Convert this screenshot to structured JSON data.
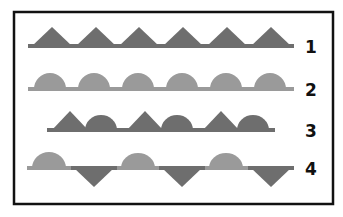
{
  "figure": {
    "frame": {
      "x": 14,
      "y": 12,
      "width": 319,
      "height": 192,
      "stroke": "#111111",
      "stroke_width": 2.5
    },
    "colors": {
      "dark": "#6e6e6e",
      "light": "#9a9a9a",
      "frame": "#111111",
      "background": "#ffffff"
    },
    "rows": [
      {
        "label": "1",
        "baseline_y": 46,
        "line": {
          "x1": 28,
          "x2": 294,
          "color": "#6e6e6e"
        },
        "shapes": [
          {
            "type": "triangle-up",
            "cx": 52,
            "w": 40,
            "h": 19,
            "color": "#6e6e6e"
          },
          {
            "type": "triangle-up",
            "cx": 96,
            "w": 40,
            "h": 19,
            "color": "#6e6e6e"
          },
          {
            "type": "triangle-up",
            "cx": 139,
            "w": 40,
            "h": 19,
            "color": "#6e6e6e"
          },
          {
            "type": "triangle-up",
            "cx": 183,
            "w": 40,
            "h": 19,
            "color": "#6e6e6e"
          },
          {
            "type": "triangle-up",
            "cx": 227,
            "w": 40,
            "h": 19,
            "color": "#6e6e6e"
          },
          {
            "type": "triangle-up",
            "cx": 271,
            "w": 40,
            "h": 19,
            "color": "#6e6e6e"
          }
        ]
      },
      {
        "label": "2",
        "baseline_y": 89,
        "line": {
          "x1": 28,
          "x2": 294,
          "color": "#9a9a9a"
        },
        "shapes": [
          {
            "type": "dome-up",
            "cx": 50,
            "w": 32,
            "h": 16,
            "color": "#9a9a9a"
          },
          {
            "type": "dome-up",
            "cx": 94,
            "w": 32,
            "h": 16,
            "color": "#9a9a9a"
          },
          {
            "type": "dome-up",
            "cx": 138,
            "w": 32,
            "h": 16,
            "color": "#9a9a9a"
          },
          {
            "type": "dome-up",
            "cx": 182,
            "w": 32,
            "h": 16,
            "color": "#9a9a9a"
          },
          {
            "type": "dome-up",
            "cx": 226,
            "w": 32,
            "h": 16,
            "color": "#9a9a9a"
          },
          {
            "type": "dome-up",
            "cx": 270,
            "w": 32,
            "h": 16,
            "color": "#9a9a9a"
          }
        ]
      },
      {
        "label": "3",
        "baseline_y": 130,
        "line": {
          "x1": 47,
          "x2": 275,
          "color": "#6e6e6e"
        },
        "shapes": [
          {
            "type": "triangle-up",
            "cx": 70,
            "w": 36,
            "h": 19,
            "color": "#6e6e6e"
          },
          {
            "type": "dome-up",
            "cx": 101,
            "w": 32,
            "h": 15,
            "color": "#6e6e6e"
          },
          {
            "type": "triangle-up",
            "cx": 145,
            "w": 36,
            "h": 19,
            "color": "#6e6e6e"
          },
          {
            "type": "dome-up",
            "cx": 177,
            "w": 32,
            "h": 15,
            "color": "#6e6e6e"
          },
          {
            "type": "triangle-up",
            "cx": 221,
            "w": 36,
            "h": 19,
            "color": "#6e6e6e"
          },
          {
            "type": "dome-up",
            "cx": 253,
            "w": 32,
            "h": 15,
            "color": "#6e6e6e"
          }
        ]
      },
      {
        "label": "4",
        "baseline_y": 168,
        "line": {
          "x1": 27,
          "x2": 293,
          "color": "#9a9a9a"
        },
        "shapes": [
          {
            "type": "dome-up",
            "cx": 49,
            "w": 34,
            "h": 16,
            "color": "#9a9a9a"
          },
          {
            "type": "triangle-down",
            "cx": 94,
            "w": 40,
            "h": 19,
            "color": "#6e6e6e"
          },
          {
            "type": "dome-up",
            "cx": 138,
            "w": 34,
            "h": 15,
            "color": "#9a9a9a"
          },
          {
            "type": "triangle-down",
            "cx": 182,
            "w": 40,
            "h": 19,
            "color": "#6e6e6e"
          },
          {
            "type": "dome-up",
            "cx": 226,
            "w": 34,
            "h": 15,
            "color": "#9a9a9a"
          },
          {
            "type": "triangle-down",
            "cx": 271,
            "w": 40,
            "h": 19,
            "color": "#6e6e6e"
          }
        ]
      }
    ],
    "label_x": 305
  }
}
